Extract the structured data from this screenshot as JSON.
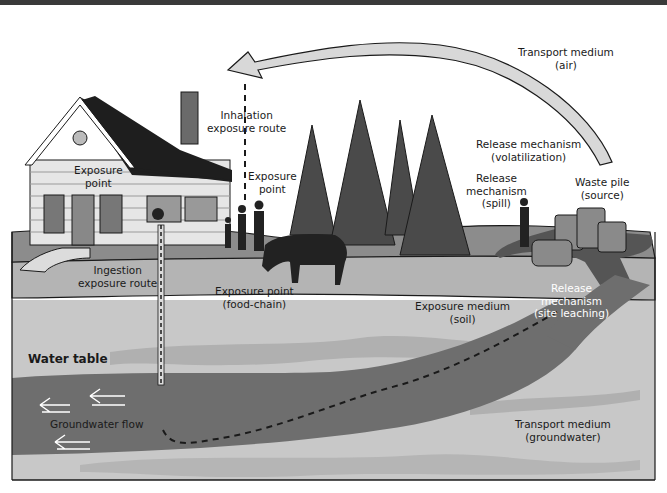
{
  "diagram": {
    "title": "",
    "labels": {
      "transport_air": [
        "Transport medium",
        "(air)"
      ],
      "inhalation": [
        "Inhalation",
        "exposure route"
      ],
      "exposure_point_house": [
        "Exposure",
        "point"
      ],
      "exposure_point_people": [
        "Exposure",
        "point"
      ],
      "release_volatilization": [
        "Release mechanism",
        "(volatilization)"
      ],
      "release_spill": [
        "Release",
        "mechanism",
        "(spill)"
      ],
      "waste_pile": [
        "Waste pile",
        "(source)"
      ],
      "ingestion": [
        "Ingestion",
        "exposure route"
      ],
      "exposure_point_food": [
        "Exposure point",
        "(food-chain)"
      ],
      "exposure_medium_soil": [
        "Exposure medium",
        "(soil)"
      ],
      "release_leaching": [
        "Release",
        "mechanism",
        "(site leaching)"
      ],
      "water_table": "Water table",
      "groundwater_flow": "Groundwater flow",
      "transport_groundwater": [
        "Transport medium",
        "(groundwater)"
      ]
    },
    "colors": {
      "ground_surface": "#8c8c8c",
      "soil_layer": "#b4b4b4",
      "aquifer_light": "#c8c8c8",
      "plume_dark": "#6e6e6e",
      "trees": "#4a4a4a",
      "roof": "#1e1e1e",
      "arrow_fill": "#d8d8d8"
    }
  }
}
